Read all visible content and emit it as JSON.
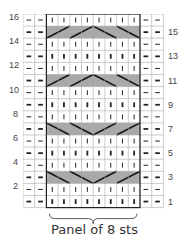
{
  "chart": {
    "rows": 16,
    "cols": 12,
    "panel_cols": [
      2,
      9
    ],
    "left_labels": [
      "2",
      "4",
      "6",
      "8",
      "10",
      "12",
      "14",
      "16"
    ],
    "right_labels": [
      "1",
      "3",
      "5",
      "7",
      "9",
      "11",
      "13",
      "15"
    ],
    "cable_rows": {
      "15": "rise",
      "11": "rise",
      "7": "fall",
      "3": "fall"
    },
    "colors": {
      "grid": "#aaaaaa",
      "cable_bg": "#a9a9a9",
      "symbol": "#222222",
      "panel_border": "#222222"
    }
  },
  "legend": {
    "bracket_label": "Panel of 8 sts"
  }
}
